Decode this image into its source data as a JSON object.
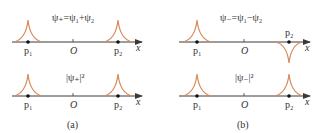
{
  "colors": {
    "axis": "#3a3a3a",
    "curve": "#d98a5c",
    "dot": "#111111",
    "text": "#333333"
  },
  "panels": [
    {
      "caption": "(a)",
      "top_plot": {
        "title": "ψ₊=ψ₁+ψ₂",
        "peaks": [
          "up",
          "up"
        ]
      },
      "bottom_plot": {
        "title": "|ψ₊|²",
        "peaks": [
          "up",
          "up"
        ]
      },
      "labels": {
        "p1": "p₁",
        "origin": "O",
        "p2": "p₂",
        "axis": "x"
      }
    },
    {
      "caption": "(b)",
      "top_plot": {
        "title": "ψ₋=ψ₁−ψ₂",
        "peaks": [
          "up",
          "down"
        ]
      },
      "bottom_plot": {
        "title": "|ψ₋|²",
        "peaks": [
          "up",
          "up"
        ]
      },
      "labels": {
        "p1": "p₁",
        "origin": "O",
        "p2": "p₂",
        "axis": "x"
      }
    }
  ]
}
